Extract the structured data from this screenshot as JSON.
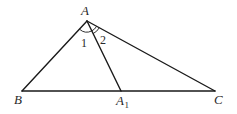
{
  "diagram": {
    "type": "triangle-with-cevian",
    "points": {
      "A": {
        "label": "A",
        "x": 87,
        "y": 21
      },
      "B": {
        "label": "B",
        "x": 22,
        "y": 91
      },
      "A1": {
        "label": "A",
        "subscript": "1",
        "x": 121,
        "y": 91
      },
      "C": {
        "label": "C",
        "x": 215,
        "y": 91
      }
    },
    "segments": [
      "AB",
      "AC",
      "BC",
      "AA1"
    ],
    "angles": [
      {
        "label": "1",
        "between": [
          "AB",
          "AA1"
        ]
      },
      {
        "label": "2",
        "between": [
          "AA1",
          "AC"
        ]
      }
    ],
    "colors": {
      "stroke": "#1a1a1a",
      "text": "#2a2a2a",
      "background": "#ffffff"
    }
  }
}
